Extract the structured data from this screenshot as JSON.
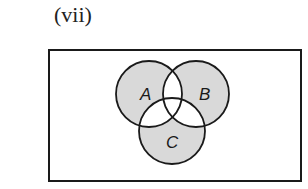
{
  "figure": {
    "part_label": "(vii)",
    "universal_set": {
      "x": 49,
      "y": 50,
      "width": 252,
      "height": 131
    },
    "sets": [
      {
        "name": "A",
        "cx": 149,
        "cy": 94,
        "r": 33,
        "label_x": 140,
        "label_y": 100
      },
      {
        "name": "B",
        "cx": 196,
        "cy": 94,
        "r": 33,
        "label_x": 199,
        "label_y": 100
      },
      {
        "name": "C",
        "cx": 172,
        "cy": 131,
        "r": 33,
        "label_x": 166,
        "label_y": 148
      }
    ],
    "shaded_regions": [
      "A only",
      "B only",
      "C only"
    ],
    "unshaded_regions": [
      "A∩B only",
      "A∩C only",
      "B∩C only",
      "A∩B∩C",
      "outside all sets"
    ],
    "colors": {
      "shade": "#d9d9d9",
      "stroke": "#1a1a1a",
      "background": "#ffffff"
    }
  }
}
